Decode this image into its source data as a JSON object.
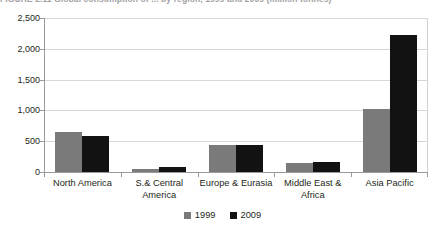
{
  "figure": {
    "title_clipped": "FIGURE 2.11    Global consumption of ... by region, 1999 and 2009 (million tonnes)"
  },
  "chart_data": {
    "type": "bar",
    "title": "",
    "xlabel": "",
    "ylabel": "",
    "categories": [
      "North America",
      "S.& Central America",
      "Europe & Eurasia",
      "Middle East & Africa",
      "Asia Pacific"
    ],
    "series": [
      {
        "name": "1999",
        "color": "#7a7a7a",
        "values": [
          650,
          45,
          440,
          150,
          1030
        ]
      },
      {
        "name": "2009",
        "color": "#121212",
        "values": [
          590,
          75,
          440,
          160,
          2230
        ]
      }
    ],
    "ylim": [
      0,
      2500
    ],
    "yticks": [
      0,
      500,
      1000,
      1500,
      2000,
      2500
    ],
    "ytick_labels": [
      "0",
      "500",
      "1,000",
      "1,500",
      "2,000",
      "2,500"
    ],
    "grid": true,
    "legend_position": "bottom"
  },
  "colors": {
    "series_1999": "#7a7a7a",
    "series_2009": "#121212",
    "gridline": "#d6d6d6",
    "axis": "#9a9a9a",
    "text": "#231f20",
    "background": "#ffffff"
  }
}
